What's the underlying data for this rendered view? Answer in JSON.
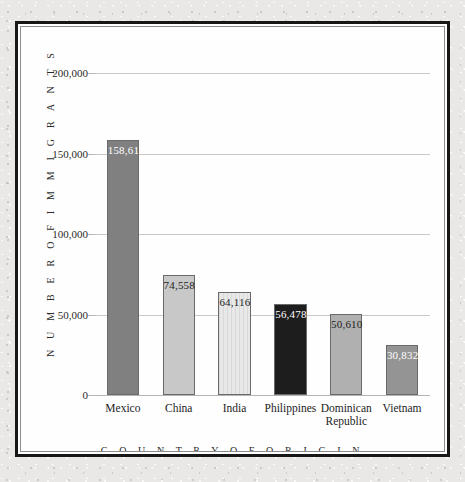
{
  "chart_data": {
    "type": "bar",
    "title": "",
    "xlabel": "C O U N T R Y   O F   O R I G I N",
    "ylabel": "N U M B E R   O F   I M M I G R A N T S",
    "categories": [
      "Mexico",
      "China",
      "India",
      "Philippines",
      "Dominican Republic",
      "Vietnam"
    ],
    "values": [
      158619,
      74558,
      64116,
      56478,
      50610,
      30832
    ],
    "value_labels": [
      "158,619",
      "74,558",
      "64,116",
      "56,478",
      "50,610",
      "30,832"
    ],
    "ylim": [
      0,
      200000
    ],
    "yticks": [
      0,
      50000,
      100000,
      150000,
      200000
    ],
    "ytick_labels": [
      "0",
      "50,000",
      "100,000",
      "150,000",
      "200,000"
    ],
    "grid": true,
    "legend": "none",
    "bar_colors": [
      "#808080",
      "#c8c8c8",
      "#e8e8e8",
      "#1d1d1d",
      "#b0b0b0",
      "#949494"
    ],
    "bar_label_colors": [
      "#ffffff",
      "#1d1d1d",
      "#1d1d1d",
      "#ffffff",
      "#1d1d1d",
      "#ffffff"
    ],
    "bar_textures": [
      "solid",
      "solid",
      "vertical-stripes",
      "solid",
      "solid",
      "solid"
    ],
    "bar_border_color": "#6a6a6a",
    "gridline_color": "#c9c9c9",
    "plot_background": "#fefefe",
    "frame_color": "#171717",
    "page_background": "#e9e8e6"
  }
}
